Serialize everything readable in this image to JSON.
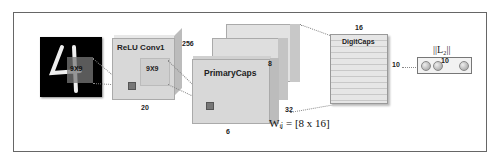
{
  "diagram": {
    "input": {
      "kernel_label": "9X9"
    },
    "conv1": {
      "title": "ReLU Conv1",
      "kernel_label": "9X9",
      "depth": "256",
      "width": "20"
    },
    "primary_caps": {
      "title": "PrimaryCaps",
      "depth": "8",
      "width": "6",
      "channels": "32"
    },
    "weight_formula": "Wᵢⱼ = [8 x 16]",
    "digit_caps": {
      "title": "DigitCaps",
      "dim": "16",
      "count": "10"
    },
    "output": {
      "norm_label": "||L₂||",
      "count": "10"
    }
  },
  "colors": {
    "border": "#666666",
    "box_fill": "#d8d8d8",
    "image_bg": "#000000"
  }
}
